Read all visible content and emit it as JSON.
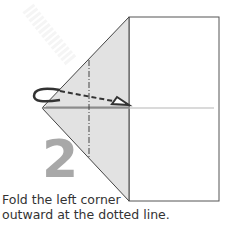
{
  "diagram": {
    "step_number": "2",
    "caption_line1": "Fold the left corner",
    "caption_line2": "outward at the dotted line.",
    "colors": {
      "paper": "#ffffff",
      "shaded_flap": "#e2e2e2",
      "outline": "#333333",
      "step_number": "#a8a8a8",
      "center_crease": "#b5b5b5",
      "watermark": "#f2f2f2"
    },
    "icons": {
      "fold_arrow": "curved-arrow-with-dashed-line",
      "fold_line": "dash-dot-valley-line"
    }
  }
}
